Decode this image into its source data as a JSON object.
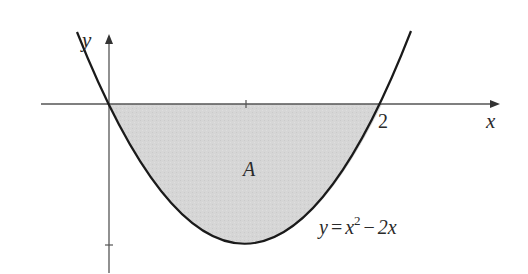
{
  "figure": {
    "type": "area-under-curve diagram",
    "axes": {
      "x_label": "x",
      "y_label": "y",
      "x_tick_labels": [
        "2"
      ],
      "x_ticks": [
        1,
        2
      ],
      "y_ticks": [
        -1
      ]
    },
    "curve": {
      "equation_lhs": "y",
      "equation_eq": "=",
      "equation_base": "x",
      "equation_exponent": "2",
      "equation_minus": "−",
      "equation_tail": "2x",
      "function": "x^2 - 2x",
      "roots": [
        0,
        2
      ],
      "vertex": [
        1,
        -1
      ]
    },
    "region": {
      "label": "A",
      "bounds": "between curve and x-axis from x=0 to x=2",
      "fill_color": "#d4d4d4"
    },
    "colors": {
      "curve": "#1a1a1a",
      "axes": "#555555",
      "shade": "#d4d4d4",
      "background": "#ffffff"
    }
  }
}
